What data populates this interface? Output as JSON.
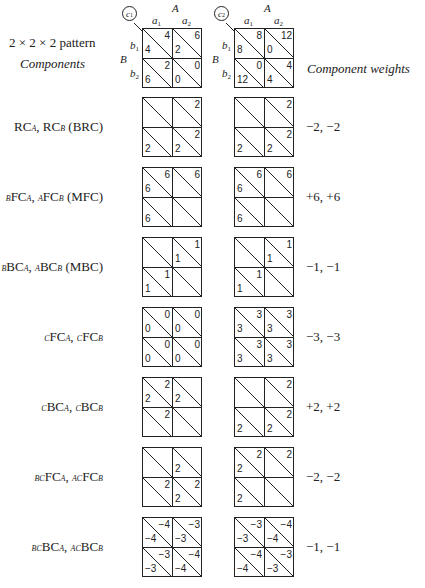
{
  "header": {
    "title": "2 × 2 × 2 pattern",
    "left_heading": "Components",
    "right_heading": "Component weights",
    "factor_A": "A",
    "factor_B": "B",
    "a_levels": [
      "a",
      "a"
    ],
    "a_subs": [
      "1",
      "2"
    ],
    "b_levels": [
      "b",
      "b"
    ],
    "b_subs": [
      "1",
      "2"
    ],
    "c_labels": [
      "c",
      "c"
    ],
    "c_subs": [
      "1",
      "2"
    ]
  },
  "rows": [
    {
      "label_html": "",
      "weights": "",
      "c1": [
        [
          "4",
          "4"
        ],
        [
          "6",
          "2"
        ],
        [
          "2",
          "6"
        ],
        [
          "0",
          "0"
        ]
      ],
      "c2": [
        [
          "8",
          "8"
        ],
        [
          "12",
          "0"
        ],
        [
          "0",
          "12"
        ],
        [
          "4",
          "4"
        ]
      ]
    },
    {
      "label_html": "RC<span class='sub'>A</span>, RC<span class='sub'>B</span> (BRC)",
      "weights": "−2,  −2",
      "c1": [
        [
          "",
          ""
        ],
        [
          "2",
          ""
        ],
        [
          "",
          "2"
        ],
        [
          "2",
          "2"
        ]
      ],
      "c2": [
        [
          "",
          ""
        ],
        [
          "2",
          ""
        ],
        [
          "",
          "2"
        ],
        [
          "2",
          "2"
        ]
      ]
    },
    {
      "label_html": "<span class='sub'>B</span>FC<span class='sub'>A</span>, <span class='sub'>A</span>FC<span class='sub'>B</span> (MFC)",
      "weights": "+6,  +6",
      "c1": [
        [
          "6",
          "6"
        ],
        [
          "6",
          ""
        ],
        [
          "",
          "6"
        ],
        [
          "",
          ""
        ]
      ],
      "c2": [
        [
          "6",
          "6"
        ],
        [
          "6",
          ""
        ],
        [
          "",
          "6"
        ],
        [
          "",
          ""
        ]
      ]
    },
    {
      "label_html": "<span class='sub'>B</span>BC<span class='sub'>A</span>, <span class='sub'>A</span>BC<span class='sub'>B</span> (MBC)",
      "weights": "−1,  −1",
      "c1": [
        [
          "",
          ""
        ],
        [
          "1",
          "1"
        ],
        [
          "1",
          "1"
        ],
        [
          "",
          ""
        ]
      ],
      "c2": [
        [
          "",
          ""
        ],
        [
          "1",
          "1"
        ],
        [
          "1",
          "1"
        ],
        [
          "",
          ""
        ]
      ]
    },
    {
      "label_html": "<span class='sub'>C</span>FC<span class='sub'>A</span>, <span class='sub'>C</span>FC<span class='sub'>B</span>",
      "weights": "−3,  −3",
      "c1": [
        [
          "0",
          "0"
        ],
        [
          "0",
          "0"
        ],
        [
          "0",
          "0"
        ],
        [
          "0",
          "0"
        ]
      ],
      "c2": [
        [
          "3",
          "3"
        ],
        [
          "3",
          "3"
        ],
        [
          "3",
          "3"
        ],
        [
          "3",
          "3"
        ]
      ]
    },
    {
      "label_html": "<span class='sub'>C</span>BC<span class='sub'>A</span>, <span class='sub'>C</span>BC<span class='sub'>B</span>",
      "weights": "+2,  +2",
      "c1": [
        [
          "2",
          "2"
        ],
        [
          "",
          "2"
        ],
        [
          "2",
          ""
        ],
        [
          "",
          ""
        ]
      ],
      "c2": [
        [
          "",
          ""
        ],
        [
          "2",
          ""
        ],
        [
          "",
          "2"
        ],
        [
          "2",
          "2"
        ]
      ]
    },
    {
      "label_html": "<span class='sub'>BC</span>FC<span class='sub'>A</span>, <span class='sub'>AC</span>FC<span class='sub'>B</span>",
      "weights": "−2,  −2",
      "c1": [
        [
          "",
          ""
        ],
        [
          "",
          "2"
        ],
        [
          "2",
          ""
        ],
        [
          "2",
          "2"
        ]
      ],
      "c2": [
        [
          "2",
          "2"
        ],
        [
          "2",
          ""
        ],
        [
          "",
          "2"
        ],
        [
          "",
          ""
        ]
      ]
    },
    {
      "label_html": "<span class='sub'>BC</span>BC<span class='sub'>A</span>, <span class='sub'>AC</span>BC<span class='sub'>B</span>",
      "weights": "−1,  −1",
      "c1": [
        [
          "−4",
          "−4"
        ],
        [
          "−3",
          "−3"
        ],
        [
          "−3",
          "−3"
        ],
        [
          "−4",
          "−4"
        ]
      ],
      "c2": [
        [
          "−3",
          "−3"
        ],
        [
          "−4",
          "−4"
        ],
        [
          "−4",
          "−4"
        ],
        [
          "−3",
          "−3"
        ]
      ]
    }
  ]
}
